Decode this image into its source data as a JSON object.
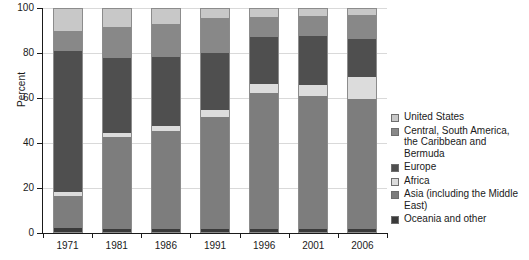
{
  "chart_data": {
    "type": "bar",
    "subtype": "stacked-bar-100-percent",
    "title": "",
    "xlabel": "",
    "ylabel": "Percent",
    "ylim": [
      0,
      100
    ],
    "yticks": [
      0,
      20,
      40,
      60,
      80,
      100
    ],
    "grid": true,
    "legend_position": "right",
    "categories": [
      "1971",
      "1981",
      "1986",
      "1991",
      "1996",
      "2001",
      "2006"
    ],
    "series": [
      {
        "name": "Oceania and other",
        "color": "#3a3a3a",
        "values": [
          2.0,
          1.5,
          1.5,
          1.5,
          1.5,
          1.5,
          1.5
        ]
      },
      {
        "name": "Asia (including the Middle East)",
        "color": "#7d7d7d",
        "values": [
          14.0,
          41.0,
          44.0,
          50.0,
          61.0,
          59.5,
          58.0
        ]
      },
      {
        "name": "Africa",
        "color": "#dcdcdc",
        "values": [
          2.0,
          2.0,
          2.0,
          3.0,
          4.0,
          5.0,
          10.0
        ]
      },
      {
        "name": "Europe",
        "color": "#4f4f4f",
        "values": [
          63.0,
          33.5,
          31.0,
          26.0,
          21.0,
          22.0,
          17.0
        ]
      },
      {
        "name": "Central, South America, the Caribbean and Bermuda",
        "color": "#888888",
        "values": [
          9.0,
          14.0,
          15.0,
          15.5,
          9.0,
          9.0,
          11.0
        ]
      },
      {
        "name": "United States",
        "color": "#c8c8c8",
        "values": [
          10.0,
          8.0,
          6.5,
          4.0,
          3.5,
          3.0,
          2.5
        ]
      }
    ]
  },
  "axis": {
    "y_title": "Percent",
    "y_tick_labels": [
      "0",
      "20",
      "40",
      "60",
      "80",
      "100"
    ],
    "x_tick_labels": [
      "1971",
      "1981",
      "1986",
      "1991",
      "1996",
      "2001",
      "2006"
    ]
  },
  "legend": {
    "items": [
      {
        "label": "United States",
        "color": "#c8c8c8"
      },
      {
        "label": "Central, South America,\nthe Caribbean and\nBermuda",
        "color": "#888888"
      },
      {
        "label": "Europe",
        "color": "#4f4f4f"
      },
      {
        "label": "Africa",
        "color": "#dcdcdc"
      },
      {
        "label": "Asia (including the Middle\nEast)",
        "color": "#7d7d7d"
      },
      {
        "label": "Oceania and other",
        "color": "#3a3a3a"
      }
    ]
  },
  "colors": {
    "background": "#ffffff",
    "axis": "#1a1a1a",
    "gridline": "#d9d9d9",
    "bar_border": "#8c8c8c"
  }
}
